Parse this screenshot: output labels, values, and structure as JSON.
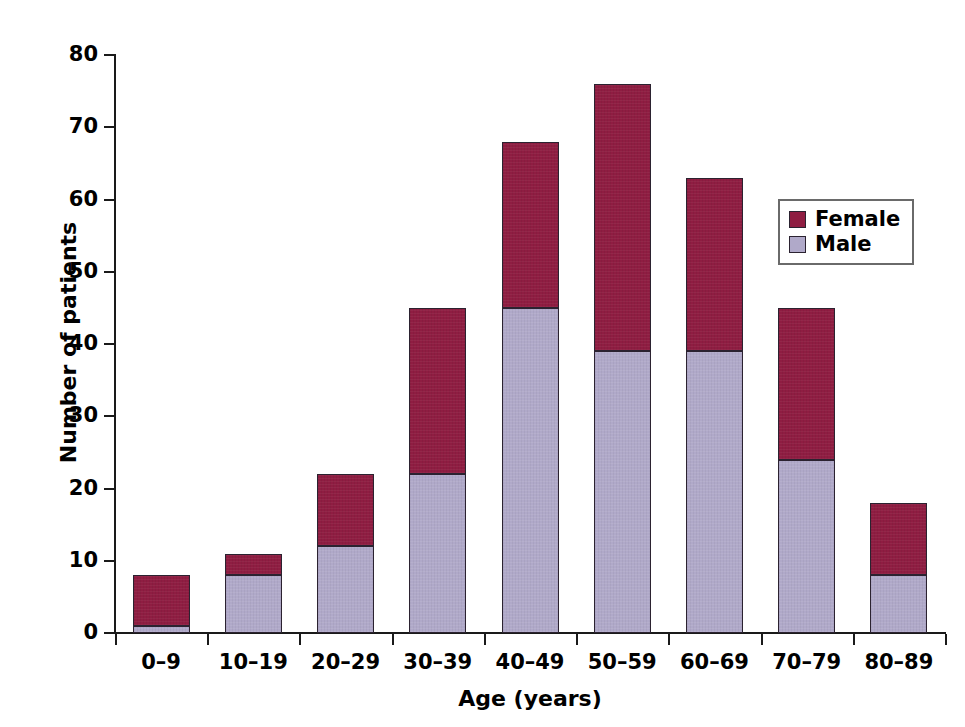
{
  "chart_data": {
    "type": "bar",
    "subtype": "stacked-vertical",
    "title": "",
    "xlabel": "Age (years)",
    "ylabel": "Number of patients",
    "categories": [
      "0–9",
      "10–19",
      "20–29",
      "30–39",
      "40–49",
      "50–59",
      "60–69",
      "70–79",
      "80–89"
    ],
    "series": [
      {
        "name": "Male",
        "color": "#b0a9c9",
        "values": [
          1,
          8,
          12,
          22,
          45,
          39,
          39,
          24,
          8
        ]
      },
      {
        "name": "Female",
        "color": "#8f1d42",
        "values": [
          7,
          3,
          10,
          23,
          23,
          37,
          24,
          21,
          10
        ]
      }
    ],
    "stack_order": [
      "Male",
      "Female"
    ],
    "totals": [
      8,
      11,
      22,
      45,
      68,
      76,
      63,
      45,
      18
    ],
    "ylim": [
      0,
      80
    ],
    "y_ticks": [
      0,
      10,
      20,
      30,
      40,
      50,
      60,
      70,
      80
    ],
    "y_tick_labels": [
      "0",
      "10",
      "20",
      "30",
      "40",
      "50",
      "60",
      "70",
      "80"
    ],
    "grid": false,
    "legend_position": "inside-upper-right",
    "legend_entries": [
      "Female",
      "Male"
    ]
  },
  "axes": {
    "y_title": "Number of patients",
    "x_title": "Age (years)"
  },
  "legend": {
    "entries": [
      {
        "label": "Female",
        "color": "#8f1d42"
      },
      {
        "label": "Male",
        "color": "#b0a9c9"
      }
    ]
  },
  "colors": {
    "female": "#8f1d42",
    "male": "#b0a9c9",
    "axis": "#1a1a1a",
    "bar_outline": "#2b2230",
    "background": "#ffffff"
  }
}
